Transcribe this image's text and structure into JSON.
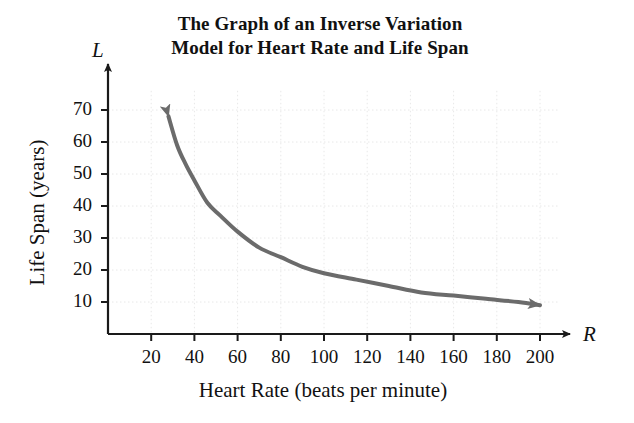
{
  "figure": {
    "title_line1": "The Graph of an Inverse Variation",
    "title_line2": "Model for Heart Rate and Life Span",
    "xaxis_variable": "R",
    "yaxis_variable": "L",
    "background_color": "#ffffff",
    "curve_color": "#6b6b6b",
    "axis_color": "#1a1a1a",
    "grid_color": "#e8e8e8"
  },
  "chart_data": {
    "type": "line",
    "title": "The Graph of an Inverse Variation Model for Heart Rate and Life Span",
    "subtitle": "",
    "xlabel": "Heart Rate (beats per minute)",
    "ylabel": "Life Span (years)",
    "x_variable": "R",
    "y_variable": "L",
    "relationship": "L = k / R (inverse variation)",
    "k": 1900,
    "xlim": [
      0,
      215
    ],
    "ylim": [
      0,
      78
    ],
    "xticks": [
      20,
      40,
      60,
      80,
      100,
      120,
      140,
      160,
      180,
      200
    ],
    "yticks": [
      10,
      20,
      30,
      40,
      50,
      60,
      70
    ],
    "xtick_labels": [
      "20",
      "40",
      "60",
      "80",
      "100",
      "120",
      "140",
      "160",
      "180",
      "200"
    ],
    "ytick_labels": [
      "10",
      "20",
      "30",
      "40",
      "50",
      "60",
      "70"
    ],
    "grid": true,
    "legend": false,
    "legend_position": "none",
    "series": [
      {
        "name": "Life Span vs Heart Rate",
        "color": "#6b6b6b",
        "line_width": 4,
        "arrow_start": true,
        "arrow_end": true,
        "x": [
          28,
          32,
          36,
          40,
          46,
          52,
          60,
          70,
          80,
          90,
          100,
          115,
          130,
          145,
          160,
          175,
          190,
          200
        ],
        "y": [
          68,
          59,
          53,
          48,
          41,
          37,
          32,
          27,
          24,
          21,
          19,
          17,
          15,
          13,
          12,
          11,
          10,
          9
        ]
      }
    ],
    "annotations": []
  }
}
